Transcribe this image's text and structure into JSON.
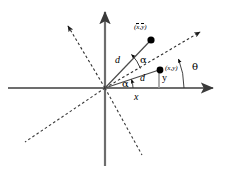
{
  "figure": {
    "type": "geometry-diagram",
    "background_color": "#ffffff",
    "stroke_color": "#555555",
    "line_color": "#000000",
    "width": 225,
    "height": 172
  },
  "axes": {
    "cartesian": {
      "x_axis_label": "",
      "y_axis_label": "",
      "origin": {
        "x": 105,
        "y": 88
      },
      "style": "solid",
      "color": "#6d6d6d"
    },
    "rotated": {
      "style": "dashed",
      "color": "#4a4a4a",
      "rotation_label": "θ"
    }
  },
  "points": [
    {
      "name": "point-mean",
      "label": "(x, y)",
      "label_x": "x",
      "label_y": "y",
      "overbar": true,
      "px": 151,
      "py": 40
    },
    {
      "name": "point-xy",
      "label": "(x,y)",
      "label_x": "x",
      "label_y": "y",
      "overbar": false,
      "px": 160,
      "py": 70
    }
  ],
  "labels": {
    "d_upper": "d",
    "d_lower": "d",
    "alpha_upper": "α",
    "alpha_lower": "α",
    "theta": "θ",
    "x_projection": "x",
    "y_projection": "y",
    "paren_open": "(",
    "paren_close": ")",
    "comma": ",",
    "mean_x": "x",
    "mean_y": "y",
    "plain_x": "x",
    "plain_y": "y"
  },
  "geometry": {
    "theta_degrees": 20,
    "alpha_degrees": 22,
    "d_value": "d"
  }
}
